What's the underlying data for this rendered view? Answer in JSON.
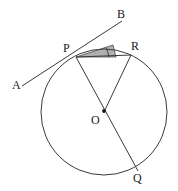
{
  "figure": {
    "type": "geometry-diagram",
    "stroke_color": "#3a3a3a",
    "label_color": "#1a1a1a",
    "shade_color": "#8c8c8c",
    "background_color": "#ffffff",
    "canvas": {
      "width": 178,
      "height": 191
    }
  },
  "circle": {
    "center_label": "O",
    "cx": 104,
    "cy": 112,
    "r": 63
  },
  "points": [
    {
      "id": "A",
      "label": "A",
      "x": 22,
      "y": 86,
      "label_x": 12,
      "label_y": 79,
      "on_circle": false
    },
    {
      "id": "B",
      "label": "B",
      "x": 119,
      "y": 24,
      "label_x": 117,
      "label_y": 8,
      "on_circle": false
    },
    {
      "id": "P",
      "label": "P",
      "x": 76,
      "y": 57,
      "label_x": 63,
      "label_y": 42,
      "on_circle": true
    },
    {
      "id": "R",
      "label": "R",
      "x": 131,
      "y": 55,
      "label_x": 131,
      "label_y": 40,
      "on_circle": true
    },
    {
      "id": "O",
      "label": "O",
      "x": 104,
      "y": 112,
      "label_x": 91,
      "label_y": 114,
      "on_circle": false
    },
    {
      "id": "Q",
      "label": "Q",
      "x": 138,
      "y": 171,
      "label_x": 133,
      "label_y": 172,
      "on_circle": true
    }
  ],
  "segments": [
    {
      "id": "tangent-AB",
      "from": "A",
      "to": "B",
      "kind": "tangent-line"
    },
    {
      "id": "chord-PR",
      "from": "P",
      "to": "R",
      "kind": "chord"
    },
    {
      "id": "diameter-PQ",
      "from": "P",
      "to": "Q",
      "kind": "diameter"
    },
    {
      "id": "radius-RO",
      "from": "R",
      "to": "O",
      "kind": "radius"
    }
  ],
  "shaded_angle": {
    "vertex": "P",
    "ray_1": "B",
    "ray_2": "R",
    "name": "angle-BPR",
    "has_arc_marker": true
  },
  "markers": {
    "center_dot": true
  }
}
